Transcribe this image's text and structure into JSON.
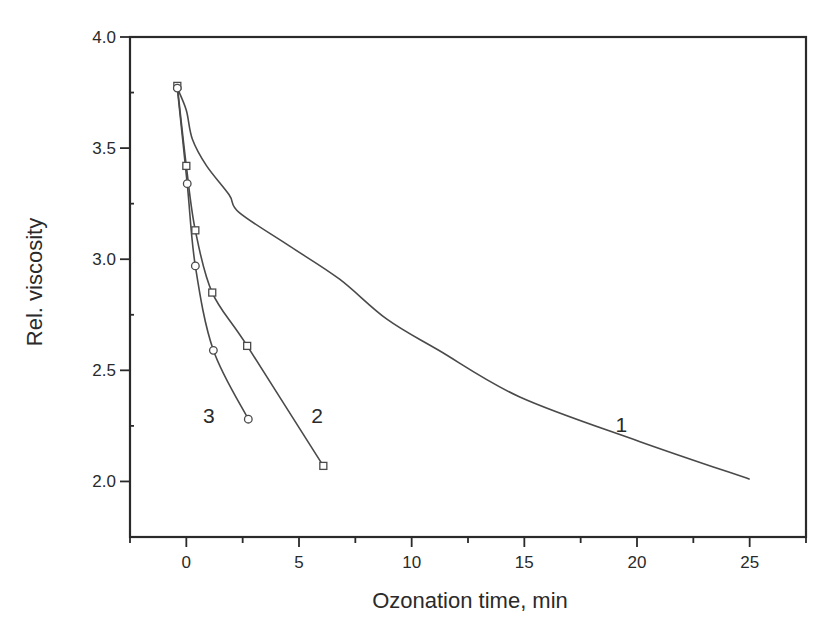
{
  "chart_data": {
    "type": "line",
    "title": "",
    "xlabel": "Ozonation time, min",
    "ylabel": "Rel. viscosity",
    "xlim": [
      -2.5,
      27.5
    ],
    "ylim": [
      1.75,
      4.0
    ],
    "x_ticks": [
      0,
      5,
      10,
      15,
      20,
      25
    ],
    "x_tick_labels": [
      "0",
      "5",
      "10",
      "15",
      "20",
      "25"
    ],
    "y_ticks": [
      2.0,
      2.5,
      3.0,
      3.5,
      4.0
    ],
    "y_tick_labels": [
      "2.0",
      "2.5",
      "3.0",
      "3.5",
      "4.0"
    ],
    "grid": false,
    "legend": "none (curves labeled inline with numbers)",
    "series": [
      {
        "name": "1",
        "marker": "none",
        "x": [
          -0.4,
          0.0,
          0.27,
          0.9,
          1.9,
          2.35,
          4.57,
          6.8,
          8.9,
          11.2,
          14.8,
          20.1,
          25.0
        ],
        "y": [
          3.77,
          3.67,
          3.54,
          3.42,
          3.29,
          3.21,
          3.06,
          2.91,
          2.73,
          2.59,
          2.38,
          2.18,
          2.01
        ],
        "label_pos": [
          19.3,
          2.26
        ]
      },
      {
        "name": "2",
        "marker": "square",
        "x": [
          -0.4,
          0.0,
          0.4,
          1.15,
          2.7,
          6.08
        ],
        "y": [
          3.78,
          3.42,
          3.13,
          2.85,
          2.61,
          2.07
        ],
        "label_pos": [
          5.8,
          2.3
        ]
      },
      {
        "name": "3",
        "marker": "circle",
        "x": [
          -0.4,
          0.04,
          0.4,
          1.2,
          2.75
        ],
        "y": [
          3.77,
          3.34,
          2.97,
          2.59,
          2.28
        ],
        "label_pos": [
          1.0,
          2.3
        ]
      }
    ]
  },
  "colors": {
    "axis": "#2a2a2a",
    "line": "#4a4a4a",
    "background": "#ffffff"
  }
}
